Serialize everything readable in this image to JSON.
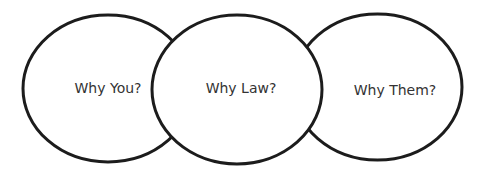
{
  "diagram": {
    "type": "overlapping-ellipses",
    "stroke_color": "#1c1c1c",
    "fill_color": "#ffffff",
    "text_color": "#333333",
    "circles": [
      {
        "label": "Why You?",
        "position": "left"
      },
      {
        "label": "Why Law?",
        "position": "center"
      },
      {
        "label": "Why Them?",
        "position": "right"
      }
    ]
  }
}
